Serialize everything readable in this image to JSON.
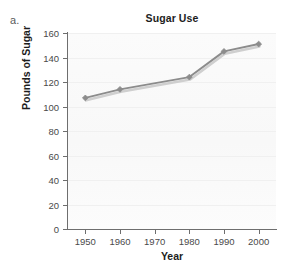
{
  "panel": {
    "letter": "a."
  },
  "chart_data": {
    "type": "line",
    "title": "Sugar Use",
    "xlabel": "Year",
    "ylabel": "Pounds of Sugar",
    "x": [
      1950,
      1960,
      1970,
      1980,
      1990,
      2000
    ],
    "categories": [
      "1950",
      "1960",
      "1970",
      "1980",
      "1990",
      "2000"
    ],
    "xtick_labels": [
      "1950",
      "1960",
      "1970",
      "1980",
      "1990",
      "2000"
    ],
    "ytick_labels": [
      "0",
      "20",
      "40",
      "60",
      "80",
      "100",
      "120",
      "140",
      "160"
    ],
    "ytick_values": [
      0,
      20,
      40,
      60,
      80,
      100,
      120,
      140,
      160
    ],
    "xlim": [
      1945,
      2005
    ],
    "ylim": [
      0,
      160
    ],
    "grid": true,
    "legend": null,
    "series": [
      {
        "name": "Sugar Use",
        "color": "#8c8c8c",
        "marker": "diamond",
        "points": [
          {
            "x": 1950,
            "y": 107
          },
          {
            "x": 1960,
            "y": 114
          },
          {
            "x": 1980,
            "y": 124
          },
          {
            "x": 1990,
            "y": 145
          },
          {
            "x": 2000,
            "y": 151
          }
        ],
        "values": [
          107,
          114,
          null,
          124,
          145,
          151
        ]
      }
    ]
  }
}
